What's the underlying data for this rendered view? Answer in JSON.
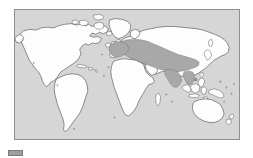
{
  "figure": {
    "type": "distribution-map",
    "projection": "equirectangular",
    "background_color": "#d6d6d6",
    "land_color": "#fdfdfd",
    "land_outline_color": "#3a3a3a",
    "range_color": "#a8a8a8",
    "range_outline_color": "#6d6d6d",
    "panel_border_color": "#8f8f8f",
    "page_background": "#ffffff"
  },
  "map": {
    "ocean_label": "ocean",
    "landmasses": [
      "North America",
      "Greenland",
      "South America",
      "Africa",
      "Europe",
      "Asia",
      "Australia",
      "Indonesia",
      "Japan",
      "New Zealand",
      "Madagascar",
      "British Isles",
      "Philippines",
      "New Guinea"
    ],
    "highlighted_region": {
      "label": "Distribution range",
      "extent_description": "Western and Central Europe eastward across Southwest and Central Asia through the Indian subcontinent to China and Southeast Asia",
      "color": "#a8a8a8"
    }
  },
  "legend": {
    "swatch_label": "range-swatch",
    "swatch_color": "#9e9e9e",
    "caption": ""
  }
}
